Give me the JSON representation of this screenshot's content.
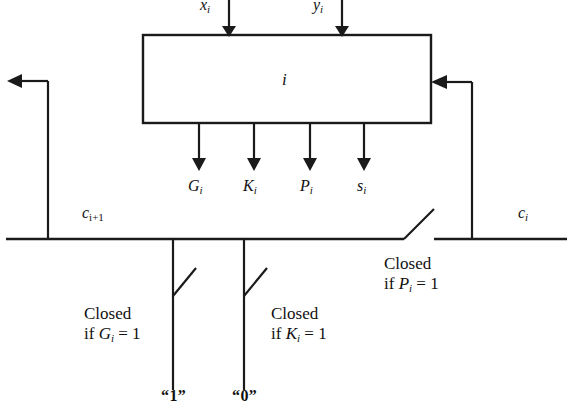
{
  "figure": {
    "block": {
      "label_base": "i"
    },
    "inputs": [
      {
        "name": "x-input",
        "base": "x",
        "sub": "i",
        "x": 205,
        "y": -3,
        "arrow_x": 229
      },
      {
        "name": "y-input",
        "base": "y",
        "sub": "i",
        "x": 318,
        "y": -3,
        "arrow_x": 342
      }
    ],
    "outputs": [
      {
        "name": "G-output",
        "base": "G",
        "sub": "i",
        "x": 190,
        "y": 176,
        "arrow_x": 199
      },
      {
        "name": "K-output",
        "base": "K",
        "sub": "i",
        "x": 245,
        "y": 176,
        "arrow_x": 254
      },
      {
        "name": "P-output",
        "base": "P",
        "sub": "i",
        "x": 301,
        "y": 176,
        "arrow_x": 310
      },
      {
        "name": "s-output",
        "base": "s",
        "sub": "i",
        "x": 356,
        "y": 176,
        "arrow_x": 364
      }
    ],
    "carry_out": {
      "base": "c",
      "sub": "i+1",
      "x": 82,
      "y": 203
    },
    "carry_in": {
      "base": "c",
      "sub": "i",
      "x": 518,
      "y": 203
    },
    "switches": [
      {
        "name": "p-switch",
        "line1": "Closed",
        "cond_if": "if",
        "cond_var": "P",
        "cond_sub": "i",
        "cond_eq": "= 1",
        "x": 384,
        "y": 253
      },
      {
        "name": "g-switch",
        "line1": "Closed",
        "cond_if": "if",
        "cond_var": "G",
        "cond_sub": "i",
        "cond_eq": "= 1",
        "x": 84,
        "y": 303
      },
      {
        "name": "k-switch",
        "line1": "Closed",
        "cond_if": "if",
        "cond_var": "K",
        "cond_sub": "i",
        "cond_eq": "= 1",
        "x": 271,
        "y": 303
      }
    ],
    "rails": [
      {
        "name": "rail-one",
        "label": "“1”",
        "x": 163,
        "y": 386
      },
      {
        "name": "rail-zero",
        "label": "“0”",
        "x": 234,
        "y": 386
      }
    ],
    "colors": {
      "ink": "#1a1a1a",
      "background": "#ffffff"
    }
  }
}
